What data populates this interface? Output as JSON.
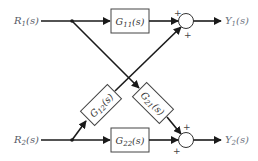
{
  "diagram": {
    "inputs": [
      {
        "id": "R1",
        "label": "R",
        "sub": "1",
        "arg": "(s)"
      },
      {
        "id": "R2",
        "label": "R",
        "sub": "2",
        "arg": "(s)"
      }
    ],
    "outputs": [
      {
        "id": "Y1",
        "label": "Y",
        "sub": "1",
        "arg": "(s)"
      },
      {
        "id": "Y2",
        "label": "Y",
        "sub": "2",
        "arg": "(s)"
      }
    ],
    "blocks": [
      {
        "id": "G11",
        "label": "G",
        "sub": "11",
        "arg": "(s)",
        "from": "R1",
        "to": "sum1"
      },
      {
        "id": "G12",
        "label": "G",
        "sub": "12",
        "arg": "(s)",
        "from": "R2",
        "to": "sum1"
      },
      {
        "id": "G21",
        "label": "G",
        "sub": "21",
        "arg": "(s)",
        "from": "R1",
        "to": "sum2"
      },
      {
        "id": "G22",
        "label": "G",
        "sub": "22",
        "arg": "(s)",
        "from": "R2",
        "to": "sum2"
      }
    ],
    "summing_junctions": [
      {
        "id": "sum1",
        "signs": [
          "+",
          "+"
        ],
        "output": "Y1"
      },
      {
        "id": "sum2",
        "signs": [
          "+",
          "+"
        ],
        "output": "Y2"
      }
    ]
  }
}
